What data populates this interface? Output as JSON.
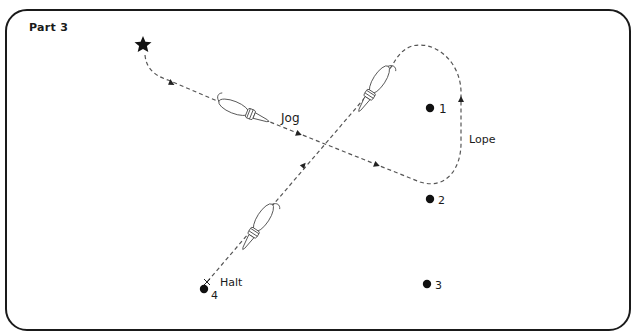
{
  "title": "Part 3",
  "labels": {
    "jog": "Jog",
    "lope": "Lope",
    "halt": "Halt"
  },
  "markers": [
    {
      "id": "1",
      "label": "1",
      "x": 430,
      "y": 108
    },
    {
      "id": "2",
      "label": "2",
      "x": 430,
      "y": 199
    },
    {
      "id": "3",
      "label": "3",
      "x": 427,
      "y": 284
    },
    {
      "id": "4",
      "label": "4",
      "x": 204,
      "y": 289
    }
  ],
  "start": {
    "icon": "star-icon",
    "x": 143,
    "y": 44
  },
  "end": {
    "icon": "x-mark-icon",
    "x": 207,
    "y": 282
  },
  "colors": {
    "ink": "#1a1a1a",
    "path": "#555555",
    "background": "#ffffff"
  }
}
